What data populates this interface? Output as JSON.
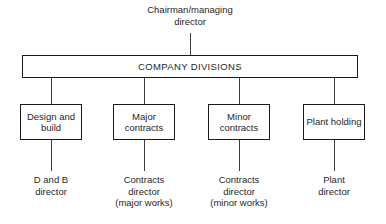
{
  "diagram": {
    "root": {
      "lines": [
        "Chairman/managing",
        "director"
      ]
    },
    "divisions_bar": {
      "label": "COMPANY DIVISIONS"
    },
    "divisions": [
      {
        "label": "Design and build",
        "leaf_lines": [
          "D and B",
          "director"
        ]
      },
      {
        "label": "Major contracts",
        "leaf_lines": [
          "Contracts",
          "director",
          "(major works)"
        ]
      },
      {
        "label": "Minor contracts",
        "leaf_lines": [
          "Contracts",
          "director",
          "(minor works)"
        ]
      },
      {
        "label": "Plant holding",
        "leaf_lines": [
          "Plant",
          "director"
        ]
      }
    ],
    "colors": {
      "line": "#1a1a1a",
      "text": "#1f1f1f",
      "background": "#ffffff"
    }
  }
}
